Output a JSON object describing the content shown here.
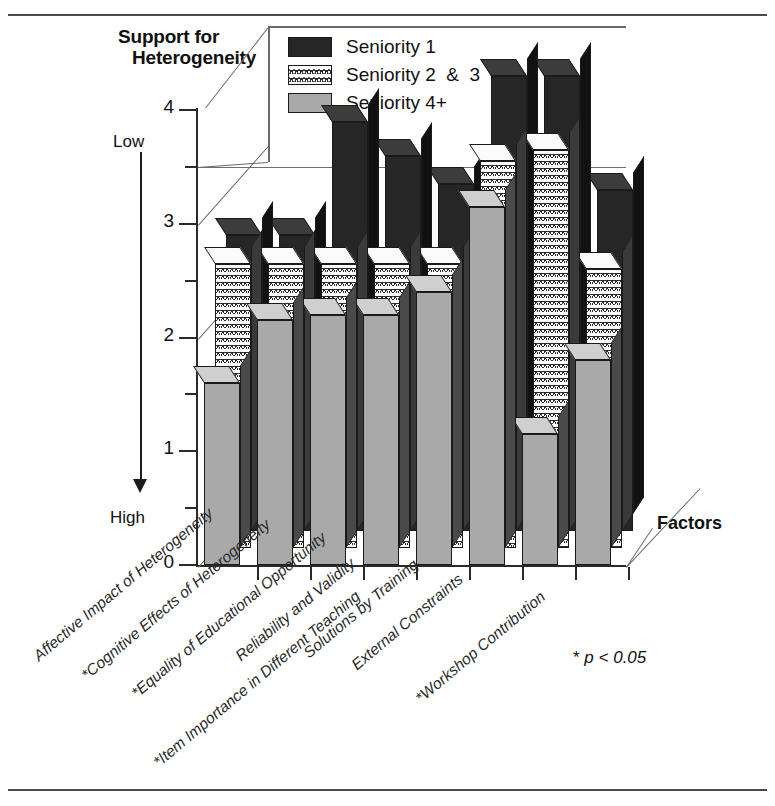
{
  "chart_data": {
    "type": "bar",
    "title": "Support for Heterogeneity",
    "title_line1": "Support for",
    "title_line2": "Heterogeneity",
    "xlabel": "Factors",
    "ylabel": "Support for Heterogeneity",
    "ylim": [
      0,
      4
    ],
    "yticks": [
      0,
      1,
      2,
      3,
      4
    ],
    "ytick_labels": [
      "0",
      "1",
      "2",
      "3",
      "4"
    ],
    "y_minor_ticks": [
      0.5,
      1.5,
      2.5,
      3.5
    ],
    "scale_high_label": "Low",
    "scale_low_label": "High",
    "grid": true,
    "gridlines": [
      3.5
    ],
    "legend_position": "top-right",
    "footnote": "p < 0.05",
    "footnote_marker": "*",
    "categories": [
      "Affective Impact of Heterogeneity",
      "*Cognitive Effects of Heterogeneity",
      "*Equality of Educational Opportunity",
      "Reliability and Validity",
      "Solutions by Training",
      "External Constraints",
      "*Item Importance in Different Teaching",
      "*Workshop Contribution"
    ],
    "series": [
      {
        "name": "Seniority 1",
        "color": "#262626",
        "pattern": "solid-black",
        "values": [
          2.6,
          2.6,
          3.6,
          3.3,
          3.05,
          4.0,
          4.0,
          3.0
        ]
      },
      {
        "name": "Seniority 2  &  3",
        "color": "#fdfdfd",
        "pattern": "scalloped-hatch",
        "values": [
          2.5,
          2.5,
          2.5,
          2.5,
          2.5,
          3.4,
          3.5,
          2.45
        ]
      },
      {
        "name": "Seniority 4+",
        "color": "#a9a9a9",
        "pattern": "solid-gray",
        "values": [
          1.6,
          2.15,
          2.2,
          2.2,
          2.4,
          3.15,
          1.15,
          1.8
        ]
      }
    ]
  },
  "legend": {
    "items": [
      {
        "label": "Seniority 1",
        "swatch": "s-black"
      },
      {
        "label": "Seniority 2  &  3",
        "swatch": "s-hatch"
      },
      {
        "label": "Seniority 4+",
        "swatch": "s-gray"
      }
    ]
  }
}
